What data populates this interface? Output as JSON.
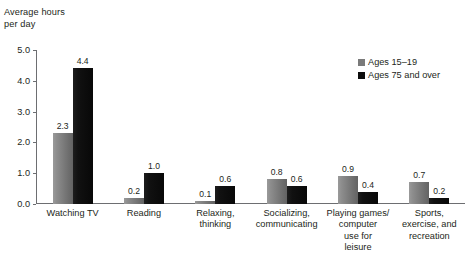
{
  "chart_data": {
    "type": "bar",
    "title": "Average hours\nper day",
    "xlabel": "",
    "ylabel": "Average hours per day",
    "ylim": [
      0.0,
      5.0
    ],
    "ytick_step": 1.0,
    "ytick_labels": [
      "0.0",
      "1.0",
      "2.0",
      "3.0",
      "4.0",
      "5.0"
    ],
    "ytick_values": [
      0.0,
      1.0,
      2.0,
      3.0,
      4.0,
      5.0
    ],
    "grid": false,
    "legend_position": "top-right",
    "categories": [
      "Watching TV",
      "Reading",
      "Relaxing,\nthinking",
      "Socializing,\ncommunicating",
      "Playing games/\ncomputer\nuse for\nleisure",
      "Sports,\nexercise, and\nrecreation"
    ],
    "series": [
      {
        "name": "Ages 15–19",
        "color": "#7a7a7a",
        "values": [
          2.3,
          0.2,
          0.1,
          0.8,
          0.9,
          0.7
        ],
        "labels": [
          "2.3",
          "0.2",
          "0.1",
          "0.8",
          "0.9",
          "0.7"
        ]
      },
      {
        "name": "Ages 75 and over",
        "color": "#0d0d0d",
        "values": [
          4.4,
          1.0,
          0.6,
          0.6,
          0.4,
          0.2
        ],
        "labels": [
          "4.4",
          "1.0",
          "0.6",
          "0.6",
          "0.4",
          "0.2"
        ]
      }
    ]
  },
  "legend": {
    "items": [
      {
        "label": "Ages 15–19",
        "swatch": "gray"
      },
      {
        "label": "Ages 75 and over",
        "swatch": "black"
      }
    ]
  }
}
